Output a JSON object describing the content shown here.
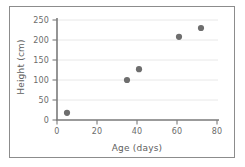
{
  "chart_data": {
    "type": "scatter",
    "title": "",
    "xlabel": "Age (days)",
    "ylabel": "Height (cm)",
    "xlim": [
      0,
      80
    ],
    "ylim": [
      0,
      250
    ],
    "xticks": [
      0,
      20,
      40,
      60,
      80
    ],
    "yticks": [
      0,
      50,
      100,
      150,
      200,
      250
    ],
    "xtick_labels": [
      "0",
      "20",
      "40",
      "60",
      "80"
    ],
    "ytick_labels": [
      "0",
      "50",
      "100",
      "150",
      "200",
      "250"
    ],
    "grid": "horizontal",
    "legend": "none",
    "series": [
      {
        "name": "plant growth",
        "marker": "circle",
        "color": "#6e6e6e",
        "points": [
          {
            "x": 5,
            "y": 18
          },
          {
            "x": 35,
            "y": 100
          },
          {
            "x": 41,
            "y": 127
          },
          {
            "x": 61,
            "y": 208
          },
          {
            "x": 72,
            "y": 230
          }
        ]
      }
    ]
  },
  "style": {
    "frame_color": "#8c8c8c",
    "axis_color": "#7a7a7a",
    "grid_color": "#e8e8e8",
    "marker_color": "#6e6e6e",
    "tick_text_color": "#6b6b6b",
    "label_text_color": "#5e5e5e",
    "background": "#ffffff"
  }
}
